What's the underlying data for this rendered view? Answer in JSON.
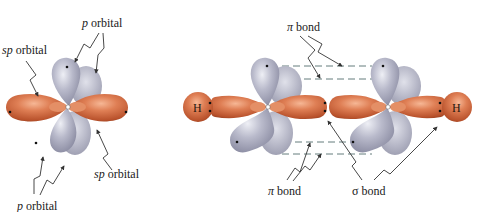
{
  "figure": {
    "left_panel": {
      "title": "sp-hybridized carbon atom",
      "labels": {
        "p_orbital_top": {
          "italic": "p",
          "text": " orbital"
        },
        "sp_orbital_left": {
          "italic": "sp",
          "text": " orbital"
        },
        "sp_orbital_right": {
          "italic": "sp",
          "text": " orbital"
        },
        "p_orbital_bottom": {
          "italic": "p",
          "text": " orbital"
        }
      }
    },
    "right_panel": {
      "title": "Ethyne (H–C≡C–H) bonding",
      "atoms": {
        "h_left": "H",
        "h_right": "H"
      },
      "labels": {
        "pi_bond_top": {
          "symbol": "π",
          "text": " bond"
        },
        "pi_bond_bottom": {
          "symbol": "π",
          "text": " bond"
        },
        "sigma_bond": {
          "symbol": "σ",
          "text": " bond"
        }
      }
    },
    "colors": {
      "sp_lobe": "#c8603a",
      "sp_lobe_highlight": "#f0a684",
      "p_lobe": "#9a9bb0",
      "p_lobe_highlight": "#e4e5ee",
      "dash_line": "#3d5a5a",
      "text": "#1a1a1a"
    }
  }
}
